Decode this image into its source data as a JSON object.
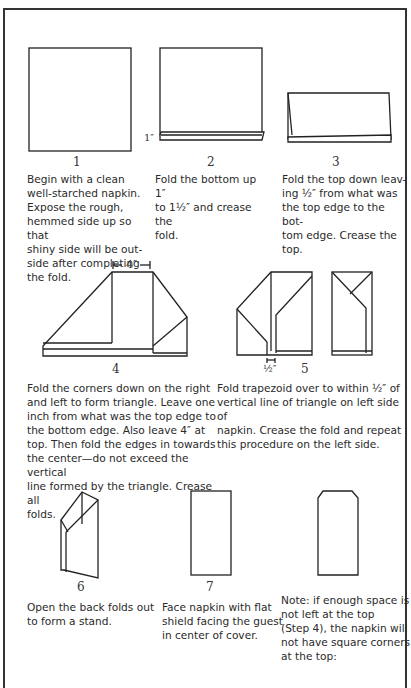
{
  "steps": [
    {
      "number": "1",
      "text": "Begin with a clean\nwell-starched napkin.\nExpose the rough,\nhemmed side up so that\nshiny side will be out-\nside after completing\nthe fold."
    },
    {
      "number": "2",
      "text": "Fold the bottom up 1″\nto 1½″ and crease the\nfold.",
      "dimension_label": "1″"
    },
    {
      "number": "3",
      "text": "Fold the top down leav-\ning ½″ from what was\nthe top edge to the bot-\ntom edge. Crease the\ntop."
    },
    {
      "number": "4",
      "text": "Fold the corners down on the right\nand left to form triangle. Leave one\ninch from what was the top edge to\nthe bottom edge. Also leave 4″ at\ntop. Then fold the edges in towards\nthe center—do not exceed the vertical\nline formed by the triangle. Crease all\nfolds.",
      "dimension_label": "4″"
    },
    {
      "number": "5",
      "text": "Fold trapezoid over to within ½″ of\nvertical line of triangle on left side of\nnapkin. Crease the fold and repeat\nthis procedure on the left side.",
      "dimension_label": "½″"
    },
    {
      "number": "6",
      "text": "Open the back folds out\nto form a stand."
    },
    {
      "number": "7",
      "text": "Face napkin with flat\nshield facing the guest\nin center of cover."
    }
  ],
  "note": {
    "text": "Note: if enough space is\nnot left at the top\n(Step 4), the napkin will\nnot have square corners\nat the top:"
  },
  "colors": {
    "line": "#222222",
    "text": "#2a2a2a",
    "background": "#ffffff"
  }
}
